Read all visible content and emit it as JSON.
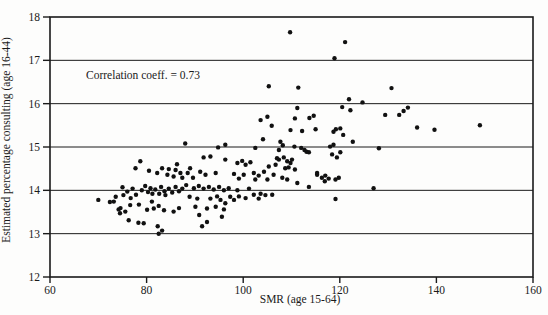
{
  "chart_data": {
    "type": "scatter",
    "title": "",
    "xlabel": "SMR (age 15-64)",
    "ylabel": "Estimated percentage consulting (age 16-44)",
    "annotation": "Correlation coeff. = 0.73",
    "xlim": [
      60,
      160
    ],
    "ylim": [
      12,
      18
    ],
    "x_ticks": [
      60,
      80,
      100,
      120,
      140,
      160
    ],
    "y_ticks": [
      12,
      13,
      14,
      15,
      16,
      17,
      18
    ],
    "grid": "horizontal",
    "legend": "none",
    "marker_color": "#111111",
    "frame_color": "#1a1a1a",
    "points": [
      [
        70,
        13.78
      ],
      [
        72.4,
        13.73
      ],
      [
        73.2,
        13.74
      ],
      [
        73.6,
        13.85
      ],
      [
        74.2,
        13.56
      ],
      [
        74.5,
        13.47
      ],
      [
        74.6,
        13.59
      ],
      [
        75,
        14.07
      ],
      [
        75.2,
        13.89
      ],
      [
        75.6,
        13.51
      ],
      [
        76,
        13.97
      ],
      [
        76.3,
        13.31
      ],
      [
        76.6,
        13.66
      ],
      [
        76.7,
        13.82
      ],
      [
        77.1,
        14.04
      ],
      [
        77.7,
        14.51
      ],
      [
        77.8,
        13.9
      ],
      [
        78.3,
        13.25
      ],
      [
        78.4,
        13.67
      ],
      [
        78.7,
        14.67
      ],
      [
        79,
        14
      ],
      [
        79.4,
        13.24
      ],
      [
        79.7,
        14.1
      ],
      [
        80.1,
        13.55
      ],
      [
        80.3,
        13.96
      ],
      [
        80.5,
        14.45
      ],
      [
        80.8,
        14.05
      ],
      [
        81.1,
        13.74
      ],
      [
        81.2,
        13.92
      ],
      [
        81.5,
        13.58
      ],
      [
        81.8,
        14.02
      ],
      [
        82.2,
        14.4
      ],
      [
        82.3,
        13.17
      ],
      [
        82.5,
        13
      ],
      [
        82.5,
        13.64
      ],
      [
        82.6,
        13.92
      ],
      [
        83,
        14.08
      ],
      [
        83.2,
        13.07
      ],
      [
        83.2,
        14.51
      ],
      [
        83.6,
        13.54
      ],
      [
        83.7,
        13.98
      ],
      [
        83.9,
        13.89
      ],
      [
        84.3,
        14.36
      ],
      [
        84.6,
        14.04
      ],
      [
        84.6,
        14.49
      ],
      [
        85.3,
        13.95
      ],
      [
        85.6,
        13.51
      ],
      [
        85.6,
        14.32
      ],
      [
        86,
        14.08
      ],
      [
        86,
        14.47
      ],
      [
        86.3,
        14.6
      ],
      [
        86.7,
        13.59
      ],
      [
        86.7,
        13.98
      ],
      [
        87,
        14.4
      ],
      [
        87.4,
        14.04
      ],
      [
        87.4,
        14.29
      ],
      [
        88,
        15.08
      ],
      [
        88.2,
        14.12
      ],
      [
        88.5,
        14.4
      ],
      [
        88.9,
        13.85
      ],
      [
        89,
        14.51
      ],
      [
        89.6,
        14.29
      ],
      [
        89.8,
        14.05
      ],
      [
        90.1,
        13.62
      ],
      [
        90.5,
        13.81
      ],
      [
        90.8,
        14.1
      ],
      [
        90.9,
        13.43
      ],
      [
        91.1,
        14.43
      ],
      [
        91.5,
        13.17
      ],
      [
        91.8,
        14.04
      ],
      [
        91.8,
        14.76
      ],
      [
        92.2,
        14.36
      ],
      [
        92.5,
        13.27
      ],
      [
        92.5,
        13.58
      ],
      [
        92.9,
        14.08
      ],
      [
        93.2,
        13.81
      ],
      [
        93.2,
        14.78
      ],
      [
        93.9,
        14.02
      ],
      [
        94.3,
        13.62
      ],
      [
        94.3,
        14.4
      ],
      [
        94.6,
        13.86
      ],
      [
        94.8,
        14.99
      ],
      [
        95,
        14.08
      ],
      [
        95.3,
        13.78
      ],
      [
        95.6,
        13.39
      ],
      [
        96,
        13.56
      ],
      [
        96,
        14
      ],
      [
        96.3,
        13.7
      ],
      [
        96.3,
        14.71
      ],
      [
        96.3,
        15.05
      ],
      [
        97,
        14.05
      ],
      [
        97.3,
        13.85
      ],
      [
        98.1,
        13.78
      ],
      [
        98.1,
        14.38
      ],
      [
        98.8,
        14
      ],
      [
        98.8,
        14.63
      ],
      [
        99.1,
        13.86
      ],
      [
        99.1,
        14.27
      ],
      [
        99.8,
        14.68
      ],
      [
        100.1,
        14.36
      ],
      [
        100.5,
        13.82
      ],
      [
        100.5,
        14.59
      ],
      [
        101.2,
        14.04
      ],
      [
        101.5,
        14.65
      ],
      [
        102.2,
        13.9
      ],
      [
        102.2,
        14.4
      ],
      [
        102.5,
        14.25
      ],
      [
        102.5,
        14.98
      ],
      [
        103.2,
        13.81
      ],
      [
        103.2,
        14.34
      ],
      [
        103.6,
        13.92
      ],
      [
        103.6,
        15.62
      ],
      [
        104.1,
        15.18
      ],
      [
        104.3,
        14.43
      ],
      [
        104.6,
        13.89
      ],
      [
        105,
        14.25
      ],
      [
        105,
        15.7
      ],
      [
        105.3,
        14.55
      ],
      [
        105.3,
        16.4
      ],
      [
        105.9,
        15.49
      ],
      [
        106,
        13.9
      ],
      [
        106.3,
        14.36
      ],
      [
        106.7,
        14.59
      ],
      [
        107,
        14.74
      ],
      [
        107.4,
        14.71
      ],
      [
        107.4,
        14.93
      ],
      [
        107.7,
        15.12
      ],
      [
        108.1,
        14.29
      ],
      [
        108.2,
        15.04
      ],
      [
        108.4,
        14.76
      ],
      [
        108.7,
        14.51
      ],
      [
        109.1,
        14.25
      ],
      [
        109.1,
        14.67
      ],
      [
        109.4,
        14.53
      ],
      [
        109.7,
        17.65
      ],
      [
        109.8,
        14.63
      ],
      [
        109.8,
        15.39
      ],
      [
        110.1,
        14.71
      ],
      [
        110.6,
        15.01
      ],
      [
        110.7,
        14.48
      ],
      [
        110.7,
        15.66
      ],
      [
        111.2,
        14.17
      ],
      [
        111.2,
        15.9
      ],
      [
        111.4,
        16.37
      ],
      [
        112,
        14.98
      ],
      [
        112.2,
        15.37
      ],
      [
        112.7,
        14.93
      ],
      [
        113.1,
        14.89
      ],
      [
        113.6,
        14.08
      ],
      [
        113.6,
        14.88
      ],
      [
        113.7,
        15.67
      ],
      [
        114.6,
        15.72
      ],
      [
        115,
        15.41
      ],
      [
        115.3,
        14.36
      ],
      [
        115.3,
        14.4
      ],
      [
        116.3,
        14.29
      ],
      [
        116.9,
        14.21
      ],
      [
        117,
        14.34
      ],
      [
        117.7,
        14.27
      ],
      [
        118,
        15.01
      ],
      [
        118.4,
        14.83
      ],
      [
        118.7,
        15.05
      ],
      [
        118.7,
        15.35
      ],
      [
        118.9,
        17.05
      ],
      [
        119.1,
        13.8
      ],
      [
        119.1,
        14.25
      ],
      [
        119.2,
        15.41
      ],
      [
        119.4,
        14.76
      ],
      [
        119.8,
        14.29
      ],
      [
        120.1,
        14.88
      ],
      [
        120.1,
        15.43
      ],
      [
        120.5,
        15.92
      ],
      [
        120.7,
        15.28
      ],
      [
        121.1,
        17.42
      ],
      [
        121.9,
        16.1
      ],
      [
        122.2,
        15.85
      ],
      [
        122.7,
        15.12
      ],
      [
        124.7,
        16.03
      ],
      [
        127,
        14.05
      ],
      [
        128.1,
        14.97
      ],
      [
        129.4,
        15.74
      ],
      [
        130.7,
        16.36
      ],
      [
        132.3,
        15.74
      ],
      [
        133.2,
        15.83
      ],
      [
        134.1,
        15.91
      ],
      [
        136,
        15.45
      ],
      [
        139.6,
        15.4
      ],
      [
        149,
        15.5
      ]
    ]
  }
}
